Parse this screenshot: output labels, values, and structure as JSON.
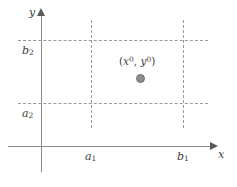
{
  "figure": {
    "axes": {
      "x_label": "x",
      "y_label": "y"
    },
    "tick_labels": {
      "x_lower": "a",
      "x_lower_sub": "1",
      "x_upper": "b",
      "x_upper_sub": "1",
      "y_lower": "a",
      "y_lower_sub": "2",
      "y_upper": "b",
      "y_upper_sub": "2"
    },
    "point": {
      "open_paren": "(",
      "x_var": "x",
      "x_sup": "0",
      "comma": ", ",
      "y_var": "y",
      "y_sup": "0",
      "close_paren": ")"
    },
    "colors": {
      "axis": "#8a8a8a",
      "arrow": "#5a5a5a",
      "dashed": "#9a9a9a",
      "point_fill": "#8c8c8c",
      "text": "#3d3d3d",
      "background": "#ffffff"
    }
  },
  "chart_data": {
    "type": "scatter",
    "title": "",
    "xlabel": "x",
    "ylabel": "y",
    "grid": false,
    "legend": null,
    "xlim": [
      0,
      1
    ],
    "ylim": [
      0,
      1
    ],
    "x_tick_labels": [
      "a₁",
      "b₁"
    ],
    "y_tick_labels": [
      "a₂",
      "b₂"
    ],
    "x_ticks": [
      0.29,
      0.77
    ],
    "y_ticks": [
      0.33,
      0.8
    ],
    "points": [
      {
        "label": "(x⁰, y⁰)",
        "x": 0.53,
        "y": 0.52
      }
    ],
    "annotations": [
      {
        "text": "(x⁰, y⁰)",
        "x": 0.46,
        "y": 0.63,
        "describes": "label for the marked interior point"
      }
    ],
    "regions": [
      {
        "kind": "dashed-rectangle",
        "x_range": [
          "a₁",
          "b₁"
        ],
        "y_range": [
          "a₂",
          "b₂"
        ],
        "linestyle": "dashed",
        "filled": false
      }
    ]
  }
}
